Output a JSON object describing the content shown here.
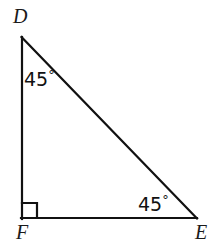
{
  "figure": {
    "type": "geometry-diagram",
    "shape": "right-triangle",
    "background_color": "#ffffff",
    "stroke_color": "#111111",
    "stroke_width": 2,
    "vertices": [
      {
        "name": "D",
        "label": "D",
        "x": 21,
        "y": 37,
        "position": "top-left"
      },
      {
        "name": "F",
        "label": "F",
        "x": 21,
        "y": 218,
        "position": "bottom-left"
      },
      {
        "name": "E",
        "label": "E",
        "x": 197,
        "y": 218,
        "position": "bottom-right"
      }
    ],
    "sides": [
      {
        "name": "DF",
        "from": "D",
        "to": "F",
        "orientation": "vertical"
      },
      {
        "name": "FE",
        "from": "F",
        "to": "E",
        "orientation": "horizontal"
      },
      {
        "name": "DE",
        "from": "D",
        "to": "E",
        "orientation": "hypotenuse"
      }
    ],
    "angles": [
      {
        "at": "D",
        "label": "45",
        "degree_symbol": "°",
        "value": 45
      },
      {
        "at": "E",
        "label": "45",
        "degree_symbol": "°",
        "value": 45
      },
      {
        "at": "F",
        "label": "",
        "degree_symbol": "",
        "value": 90,
        "marker": "right-angle-square"
      }
    ],
    "right_angle_marker": {
      "at": "F",
      "size": 15,
      "x": 21,
      "y": 203
    }
  }
}
